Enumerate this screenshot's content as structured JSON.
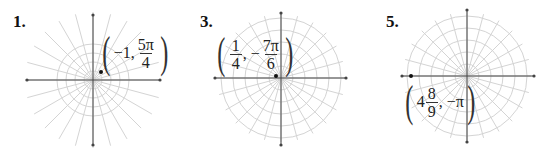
{
  "figures": [
    {
      "number": "1.",
      "center": [
        93,
        80
      ],
      "axis": {
        "left": 27,
        "right": 160,
        "top": 15,
        "bottom": 145
      },
      "circle_radii": [
        9,
        18,
        27,
        36
      ],
      "spoke_length": 68,
      "spokes": 24,
      "point": [
        101,
        72
      ],
      "label": {
        "prefix": "−",
        "whole": "1,",
        "frac_num": "5π",
        "frac_den": "4",
        "suffix": ""
      },
      "polar": {
        "r": -1,
        "theta": "5π/4"
      }
    },
    {
      "number": "3.",
      "center": [
        281,
        78
      ],
      "axis": {
        "left": 215,
        "right": 346,
        "top": 13,
        "bottom": 145
      },
      "circle_radii": [
        12,
        24,
        36,
        48,
        60
      ],
      "spoke_length": 64,
      "spokes": 24,
      "point": [
        276,
        76
      ],
      "label": {
        "frac1_num": "1",
        "frac1_den": "4",
        "sep": ", −",
        "frac2_num": "7π",
        "frac2_den": "6"
      },
      "polar": {
        "r": "1/4",
        "theta": "-7π/6"
      }
    },
    {
      "number": "5.",
      "center": [
        467,
        76
      ],
      "axis": {
        "left": 402,
        "right": 534,
        "top": 10,
        "bottom": 142
      },
      "circle_radii": [
        12,
        24,
        36,
        48,
        60
      ],
      "spoke_length": 64,
      "spokes": 24,
      "point": [
        411,
        76
      ],
      "label": {
        "whole": "4",
        "frac_num": "8",
        "frac_den": "9",
        "suffix": ", −π"
      },
      "polar": {
        "r": "4 8/9",
        "theta": "-π"
      }
    }
  ],
  "colors": {
    "grid": "#d4d4d4",
    "axis": "#444444",
    "point": "#111111"
  }
}
